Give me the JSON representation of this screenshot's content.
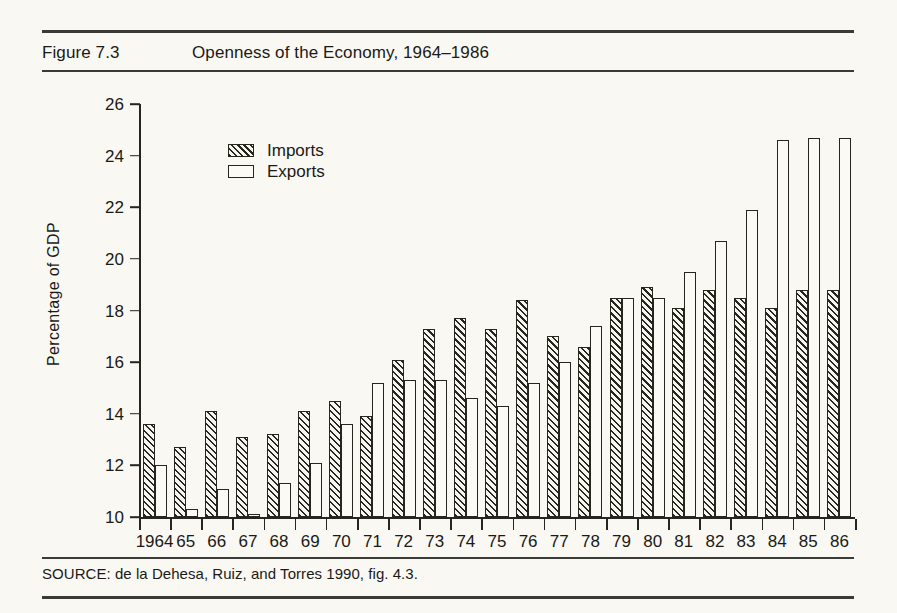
{
  "figure": {
    "number_label": "Figure 7.3",
    "title": "Openness of the Economy, 1964–1986",
    "source": "SOURCE: de la Dehesa, Ruiz, and Torres 1990, fig. 4.3."
  },
  "legend": {
    "position": "inside-top-left",
    "entries": [
      {
        "label": "Imports",
        "swatch": "hatched-diagonal"
      },
      {
        "label": "Exports",
        "swatch": "white-outline"
      }
    ]
  },
  "colors": {
    "ink": "#26261f",
    "paper": "#faf8f2",
    "bar_fill_exports": "#fbfaf5",
    "bar_fill_imports": "#f7f5ef"
  },
  "chart_data": {
    "type": "bar",
    "title": "Openness of the Economy, 1964–1986",
    "xlabel": "",
    "ylabel": "Percentage of GDP",
    "ylim": [
      10,
      26
    ],
    "yticks": [
      10,
      12,
      14,
      16,
      18,
      20,
      22,
      24,
      26
    ],
    "grid": false,
    "legend_position": "inside-top-left",
    "categories": [
      "1964",
      "65",
      "66",
      "67",
      "68",
      "69",
      "70",
      "71",
      "72",
      "73",
      "74",
      "75",
      "76",
      "77",
      "78",
      "79",
      "80",
      "81",
      "82",
      "83",
      "84",
      "85",
      "86"
    ],
    "series": [
      {
        "name": "Imports",
        "values": [
          13.6,
          12.7,
          14.1,
          13.1,
          13.2,
          14.1,
          14.5,
          13.9,
          16.1,
          17.3,
          17.7,
          17.3,
          18.4,
          17.0,
          16.6,
          18.5,
          18.9,
          18.1,
          18.8,
          18.5,
          18.1,
          18.8,
          18.8
        ]
      },
      {
        "name": "Exports",
        "values": [
          12.0,
          10.3,
          11.1,
          10.1,
          11.3,
          12.1,
          13.6,
          15.2,
          15.3,
          15.3,
          14.6,
          14.3,
          15.2,
          16.0,
          17.4,
          18.5,
          18.5,
          19.5,
          20.7,
          21.9,
          24.6,
          24.7,
          24.7
        ]
      }
    ]
  }
}
